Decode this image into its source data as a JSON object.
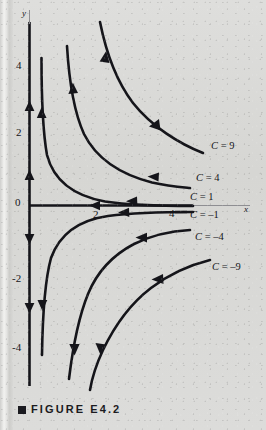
{
  "figure": {
    "caption": "FIGURE E4.2",
    "caption_marker": "square-bullet"
  },
  "axes": {
    "x_name": "x",
    "y_name": "y",
    "origin_label": "0",
    "x_ticks": [
      "2",
      "4"
    ],
    "y_ticks": [
      "4",
      "2",
      "0",
      "-2",
      "-4"
    ],
    "x_arrow": "left",
    "y_arrows": "up-and-down"
  },
  "curve_labels": [
    {
      "id": "c9",
      "text": "C = 9",
      "x": 211,
      "y": 141
    },
    {
      "id": "c4",
      "text": "C = 4",
      "x": 196,
      "y": 173
    },
    {
      "id": "c1",
      "text": "C = 1",
      "x": 190,
      "y": 192
    },
    {
      "id": "cm1",
      "text": "C = –1",
      "x": 190,
      "y": 210
    },
    {
      "id": "cm4",
      "text": "C = –4",
      "x": 195,
      "y": 232
    },
    {
      "id": "cm9",
      "text": "C = –9",
      "x": 212,
      "y": 262
    }
  ],
  "colors": {
    "ink": "#15151a",
    "paper": "#d9d9d7",
    "axis": "#1a1a1f"
  },
  "chart_data": {
    "type": "line",
    "title": "FIGURE E4.2",
    "xlabel": "x",
    "ylabel": "y",
    "grid": false,
    "legend": "inline-right-labels",
    "xlim": [
      -0.3,
      6.4
    ],
    "ylim": [
      -5.2,
      5.6
    ],
    "xticks": [
      2,
      4
    ],
    "yticks": [
      -4,
      -2,
      0,
      2,
      4
    ],
    "series": [
      {
        "name": "C = 9",
        "C": 9,
        "equation": "y = 9/x",
        "points": [
          [
            1.6,
            5.6
          ],
          [
            2.0,
            4.5
          ],
          [
            2.5,
            3.6
          ],
          [
            3.0,
            3.0
          ],
          [
            3.5,
            2.57
          ],
          [
            4.0,
            2.25
          ],
          [
            4.5,
            2.0
          ],
          [
            5.0,
            1.8
          ],
          [
            5.2,
            1.73
          ]
        ],
        "arrow_at": [
          [
            2.25,
            4.0
          ],
          [
            4.0,
            2.25
          ]
        ],
        "arrow_direction": "toward-origin-along-curve"
      },
      {
        "name": "C = 4",
        "C": 4,
        "equation": "y = 4/x",
        "points": [
          [
            0.8,
            5.0
          ],
          [
            1.0,
            4.0
          ],
          [
            1.5,
            2.67
          ],
          [
            2.0,
            2.0
          ],
          [
            2.5,
            1.6
          ],
          [
            3.0,
            1.33
          ],
          [
            3.5,
            1.14
          ],
          [
            4.0,
            1.0
          ],
          [
            4.6,
            0.87
          ]
        ],
        "arrow_at": [
          [
            1.15,
            3.5
          ],
          [
            2.8,
            1.43
          ]
        ],
        "arrow_direction": "toward-origin-along-curve"
      },
      {
        "name": "C = 1",
        "C": 1,
        "equation": "y = 1/x",
        "points": [
          [
            0.2,
            5.0
          ],
          [
            0.25,
            4.0
          ],
          [
            0.4,
            2.5
          ],
          [
            0.6,
            1.67
          ],
          [
            1.0,
            1.0
          ],
          [
            1.5,
            0.67
          ],
          [
            2.0,
            0.5
          ],
          [
            3.0,
            0.33
          ],
          [
            4.0,
            0.25
          ],
          [
            4.5,
            0.22
          ]
        ],
        "arrow_at": [
          [
            0.28,
            3.6
          ],
          [
            2.6,
            0.38
          ]
        ],
        "arrow_direction": "toward-origin-along-curve"
      },
      {
        "name": "C = -1",
        "C": -1,
        "equation": "y = -1/x",
        "points": [
          [
            0.2,
            -5.0
          ],
          [
            0.25,
            -4.0
          ],
          [
            0.4,
            -2.5
          ],
          [
            0.6,
            -1.67
          ],
          [
            1.0,
            -1.0
          ],
          [
            1.5,
            -0.67
          ],
          [
            2.0,
            -0.5
          ],
          [
            3.0,
            -0.33
          ],
          [
            4.0,
            -0.25
          ],
          [
            4.5,
            -0.22
          ]
        ],
        "arrow_at": [
          [
            0.33,
            -2.9
          ],
          [
            2.5,
            -0.4
          ]
        ],
        "arrow_direction": "away-from-origin-along-curve"
      },
      {
        "name": "C = -4",
        "C": -4,
        "equation": "y = -4/x",
        "points": [
          [
            0.8,
            -5.0
          ],
          [
            1.0,
            -4.0
          ],
          [
            1.5,
            -2.67
          ],
          [
            2.0,
            -2.0
          ],
          [
            2.5,
            -1.6
          ],
          [
            3.0,
            -1.33
          ],
          [
            3.5,
            -1.14
          ],
          [
            4.0,
            -1.0
          ],
          [
            4.6,
            -0.87
          ]
        ],
        "arrow_at": [
          [
            1.2,
            -3.3
          ],
          [
            2.7,
            -1.5
          ]
        ],
        "arrow_direction": "away-from-origin-along-curve"
      },
      {
        "name": "C = -9",
        "C": -9,
        "equation": "y = -9/x",
        "points": [
          [
            1.6,
            -5.6
          ],
          [
            2.0,
            -4.5
          ],
          [
            2.5,
            -3.6
          ],
          [
            3.0,
            -3.0
          ],
          [
            3.5,
            -2.57
          ],
          [
            4.0,
            -2.25
          ],
          [
            4.5,
            -2.0
          ],
          [
            5.0,
            -1.8
          ],
          [
            5.2,
            -1.73
          ]
        ],
        "arrow_at": [
          [
            2.2,
            -4.1
          ],
          [
            3.6,
            -2.5
          ]
        ],
        "arrow_direction": "away-from-origin-along-curve"
      }
    ]
  }
}
